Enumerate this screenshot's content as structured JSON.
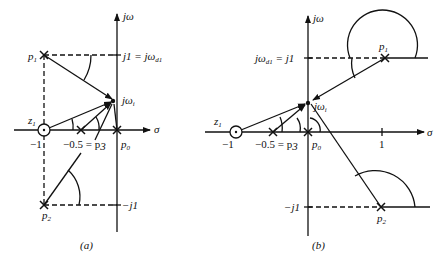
{
  "figure_a": {
    "caption": "(a)",
    "axis_imag": "jω",
    "axis_real": "σ",
    "labels": {
      "p1": "p",
      "p1_sub": "1",
      "p2": "p",
      "p2_sub": "2",
      "p0": "p",
      "p0_sub": "0",
      "z1": "z",
      "z1_sub": "1",
      "j1": "j1 = jω",
      "j1_sub": "d1",
      "neg_j1": "−j1",
      "jwi": "jω",
      "jwi_sub": "i",
      "neg1": "−1",
      "p3": "−0.5 = p",
      "p3_sub": "3"
    }
  },
  "figure_b": {
    "caption": "(b)",
    "axis_imag": "jω",
    "axis_real": "σ",
    "labels": {
      "p1": "p",
      "p1_sub": "1",
      "p2": "p",
      "p2_sub": "2",
      "p0": "p",
      "p0_sub": "0",
      "z1": "z",
      "z1_sub": "1",
      "j1": "jω",
      "j1_sub": "d1",
      "j1_rhs": " = j1",
      "neg_j1": "−j1",
      "jwi": "jω",
      "jwi_sub": "i",
      "neg1": "−1",
      "p3": "−0.5 = p",
      "p3_sub": "3",
      "one": "1"
    }
  }
}
